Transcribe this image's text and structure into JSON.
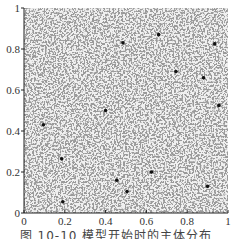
{
  "chart_data": {
    "type": "scatter",
    "title": "",
    "caption": "图 10-10  模型开始时的主体分布",
    "xlabel": "",
    "ylabel": "",
    "xlim": [
      0,
      1
    ],
    "ylim": [
      0,
      1
    ],
    "x_ticks": [
      "0",
      "0.2",
      "0.4",
      "0.6",
      "0.8",
      "1"
    ],
    "y_ticks": [
      "0",
      "0.2",
      "0.4",
      "0.6",
      "0.8",
      "1"
    ],
    "grid": false,
    "legend": null,
    "background_fill": {
      "description": "dense uniform gray scatter covering entire unit square (agents at model start)",
      "color": "#9a9a9a",
      "highlight_color": "#e8e8e8"
    },
    "series": [
      {
        "name": "black agents",
        "color": "#111111",
        "points": [
          {
            "x": 0.485,
            "y": 0.83
          },
          {
            "x": 0.66,
            "y": 0.87
          },
          {
            "x": 0.935,
            "y": 0.825
          },
          {
            "x": 0.745,
            "y": 0.69
          },
          {
            "x": 0.88,
            "y": 0.66
          },
          {
            "x": 0.095,
            "y": 0.43
          },
          {
            "x": 0.4,
            "y": 0.5
          },
          {
            "x": 0.955,
            "y": 0.525
          },
          {
            "x": 0.455,
            "y": 0.16
          },
          {
            "x": 0.505,
            "y": 0.105
          },
          {
            "x": 0.19,
            "y": 0.055
          },
          {
            "x": 0.9,
            "y": 0.13
          },
          {
            "x": 0.185,
            "y": 0.265
          },
          {
            "x": 0.625,
            "y": 0.2
          }
        ]
      }
    ]
  }
}
